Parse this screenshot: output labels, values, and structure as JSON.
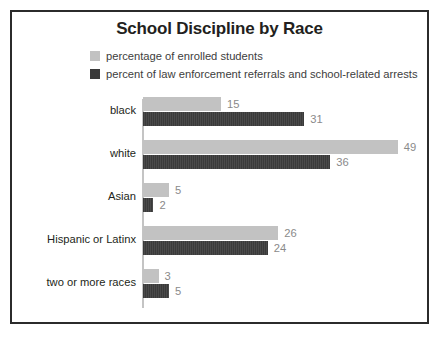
{
  "chart_data": {
    "type": "bar",
    "orientation": "horizontal",
    "title": "School Discipline by Race",
    "xlabel": "",
    "ylabel": "",
    "grid": false,
    "legend_position": "top",
    "xlim": [
      0,
      49
    ],
    "categories": [
      "black",
      "white",
      "Asian",
      "Hispanic or Latinx",
      "two or more races"
    ],
    "series": [
      {
        "name": "percentage of enrolled students",
        "color": "#c2c2c2",
        "values": [
          15,
          49,
          5,
          26,
          3
        ]
      },
      {
        "name": "percent of law enforcement referrals and school-related arrests",
        "color": "#3a3a3a",
        "values": [
          31,
          36,
          2,
          24,
          5
        ]
      }
    ]
  },
  "style": {
    "border_color": "#2b2b2b",
    "axis_color": "#c4c4c4",
    "value_label_color": "#8a8a8a",
    "title_color": "#231f20"
  }
}
